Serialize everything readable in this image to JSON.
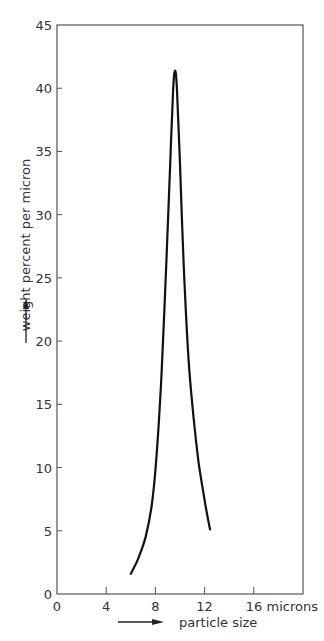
{
  "chart_data": {
    "type": "line",
    "title": "",
    "xlabel": "particle size",
    "ylabel": "weight percent per micron",
    "x_unit_label": "microns",
    "xlim": [
      0,
      20
    ],
    "ylim": [
      0,
      45
    ],
    "x_ticks": [
      0,
      4,
      8,
      12,
      16
    ],
    "x_tick_labels": [
      "0",
      "4",
      "8",
      "12",
      "16 microns"
    ],
    "y_ticks": [
      0,
      5,
      10,
      15,
      20,
      25,
      30,
      35,
      40,
      45
    ],
    "y_tick_labels": [
      "0",
      "5",
      "10",
      "15",
      "20",
      "25",
      "30",
      "35",
      "40",
      "45"
    ],
    "grid": false,
    "legend": null,
    "series": [
      {
        "name": "particle size distribution",
        "x": [
          6.0,
          6.6,
          7.2,
          7.7,
          8.1,
          8.5,
          8.9,
          9.2,
          9.45,
          9.6,
          9.75,
          10.0,
          10.3,
          10.7,
          11.1,
          11.5,
          11.9,
          12.2,
          12.45
        ],
        "y": [
          1.6,
          2.8,
          4.5,
          7.0,
          11.0,
          17.5,
          26.5,
          34.0,
          40.0,
          41.4,
          40.0,
          34.0,
          26.0,
          18.5,
          14.0,
          10.5,
          8.0,
          6.3,
          5.1
        ]
      }
    ]
  }
}
